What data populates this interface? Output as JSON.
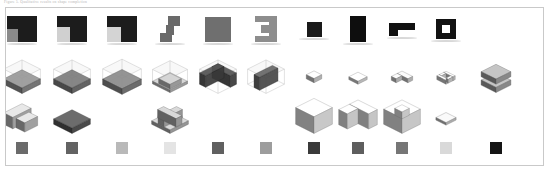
{
  "figure": {
    "caption": "Figure 5.  Qualitative results on shape completion",
    "panel_border_color": "#c9c9c9",
    "background_color": "#ffffff",
    "columns": 11,
    "rows": 4
  },
  "row_labels": {
    "shapes": "input-silhouettes",
    "recon": "reconstructed-voxels",
    "gt": "ground-truth-voxels",
    "swatches": "color-legend"
  },
  "grid": {
    "x_positions": [
      16,
      66,
      116,
      164,
      212,
      260,
      308,
      352,
      396,
      440,
      490
    ],
    "column_width": 46
  },
  "chart_data": {
    "type": "table",
    "title": "Qualitative results on shape completion",
    "categories": [
      "1",
      "2",
      "3",
      "4",
      "5",
      "6",
      "7",
      "8",
      "9",
      "10",
      "11"
    ],
    "series": [
      {
        "name": "input-silhouettes",
        "values": [
          1,
          1,
          1,
          1,
          1,
          1,
          1,
          1,
          1,
          1,
          0
        ]
      },
      {
        "name": "reconstructed-voxels",
        "values": [
          1,
          1,
          1,
          1,
          1,
          1,
          1,
          1,
          1,
          1,
          1
        ]
      },
      {
        "name": "ground-truth-voxels",
        "values": [
          1,
          1,
          0,
          1,
          0,
          0,
          1,
          1,
          1,
          1,
          0
        ]
      },
      {
        "name": "color-legend",
        "values": [
          1,
          1,
          1,
          1,
          1,
          1,
          1,
          1,
          1,
          1,
          1
        ]
      }
    ]
  },
  "silhouettes": [
    {
      "name": "block-square-notch-1",
      "fill": "#1c1c1c",
      "w": 30,
      "h": 26,
      "parts": [
        {
          "x": 0,
          "y": 0,
          "w": 30,
          "h": 26,
          "c": "#1c1c1c"
        },
        {
          "x": 0,
          "y": 13,
          "w": 11,
          "h": 13,
          "c": "#8a8a8a"
        }
      ]
    },
    {
      "name": "block-square-notch-2",
      "fill": "#1c1c1c",
      "w": 30,
      "h": 26,
      "parts": [
        {
          "x": 0,
          "y": 0,
          "w": 30,
          "h": 26,
          "c": "#1c1c1c"
        },
        {
          "x": 0,
          "y": 11,
          "w": 13,
          "h": 15,
          "c": "#d0d0d0"
        },
        {
          "x": 0,
          "y": 0,
          "w": 30,
          "h": 5,
          "c": "#1c1c1c"
        }
      ]
    },
    {
      "name": "block-square-notch-3",
      "fill": "#1c1c1c",
      "w": 30,
      "h": 26,
      "parts": [
        {
          "x": 0,
          "y": 0,
          "w": 30,
          "h": 26,
          "c": "#1c1c1c"
        },
        {
          "x": 0,
          "y": 11,
          "w": 14,
          "h": 15,
          "c": "#d4d4d4"
        }
      ]
    },
    {
      "name": "block-s-step",
      "fill": "#6a6a6a",
      "w": 20,
      "h": 26,
      "parts": [
        {
          "x": 8,
          "y": 0,
          "w": 12,
          "h": 10,
          "c": "#6a6a6a"
        },
        {
          "x": 6,
          "y": 9,
          "w": 8,
          "h": 10,
          "c": "#6a6a6a"
        },
        {
          "x": 0,
          "y": 17,
          "w": 12,
          "h": 9,
          "c": "#6a6a6a"
        }
      ]
    },
    {
      "name": "block-solid-square",
      "fill": "#6f6f6f",
      "w": 26,
      "h": 25,
      "parts": [
        {
          "x": 0,
          "y": 0,
          "w": 26,
          "h": 25,
          "c": "#6f6f6f"
        }
      ]
    },
    {
      "name": "block-c-bracket",
      "fill": "#8d8d8d",
      "w": 22,
      "h": 26,
      "parts": [
        {
          "x": 0,
          "y": 0,
          "w": 22,
          "h": 6,
          "c": "#8d8d8d"
        },
        {
          "x": 14,
          "y": 0,
          "w": 8,
          "h": 26,
          "c": "#8d8d8d"
        },
        {
          "x": 0,
          "y": 20,
          "w": 22,
          "h": 6,
          "c": "#8d8d8d"
        },
        {
          "x": 6,
          "y": 9,
          "w": 10,
          "h": 8,
          "c": "#8d8d8d"
        }
      ]
    },
    {
      "name": "block-small-square",
      "fill": "#1a1a1a",
      "w": 15,
      "h": 15,
      "parts": [
        {
          "x": 0,
          "y": 0,
          "w": 15,
          "h": 15,
          "c": "#1a1a1a"
        }
      ]
    },
    {
      "name": "block-tall-rect",
      "fill": "#0e0e0e",
      "w": 16,
      "h": 26,
      "parts": [
        {
          "x": 0,
          "y": 0,
          "w": 16,
          "h": 26,
          "c": "#0e0e0e"
        }
      ]
    },
    {
      "name": "block-l-flag",
      "fill": "#111111",
      "w": 26,
      "h": 13,
      "parts": [
        {
          "x": 0,
          "y": 0,
          "w": 26,
          "h": 7,
          "c": "#111111"
        },
        {
          "x": 0,
          "y": 6,
          "w": 9,
          "h": 7,
          "c": "#111111"
        }
      ]
    },
    {
      "name": "block-ring-square",
      "fill": "#121212",
      "w": 20,
      "h": 20,
      "parts": [
        {
          "x": 0,
          "y": 0,
          "w": 20,
          "h": 20,
          "c": "#121212"
        },
        {
          "x": 6,
          "y": 6,
          "w": 8,
          "h": 8,
          "c": "#ffffff"
        }
      ]
    }
  ],
  "recon": [
    {
      "name": "iso-slab-low",
      "style": "slab",
      "box": true,
      "tone": "#6e6e6e",
      "scale": 1.0
    },
    {
      "name": "iso-slab-thin",
      "style": "slab",
      "box": true,
      "tone": "#5a5a5a",
      "scale": 1.0
    },
    {
      "name": "iso-slab-wide",
      "style": "slab",
      "box": true,
      "tone": "#656565",
      "scale": 1.05
    },
    {
      "name": "iso-notch-step",
      "style": "step",
      "box": true,
      "tone": "#9a9a9a",
      "scale": 0.95
    },
    {
      "name": "iso-open-corner",
      "style": "corner",
      "box": true,
      "tone": "#3b3b3b",
      "scale": 1.0
    },
    {
      "name": "iso-wall-panel",
      "style": "wall",
      "box": true,
      "tone": "#4a4a4a",
      "scale": 1.0
    },
    {
      "name": "iso-tiny-cube",
      "style": "cube",
      "box": false,
      "tone": "#b8b8b8",
      "scale": 0.42
    },
    {
      "name": "iso-tiny-plate",
      "style": "plate",
      "box": false,
      "tone": "#c2c2c2",
      "scale": 0.5
    },
    {
      "name": "iso-chevron",
      "style": "chevron",
      "box": false,
      "tone": "#b6b6b6",
      "scale": 0.58
    },
    {
      "name": "iso-hex-ring",
      "style": "ring",
      "box": false,
      "tone": "#bdbdbd",
      "scale": 0.5
    },
    {
      "name": "iso-stack-pair",
      "style": "stack",
      "box": false,
      "tone": "#8f8f8f",
      "scale": 0.95
    }
  ],
  "gt": [
    {
      "name": "iso-gt-pair",
      "style": "pair",
      "tone": "#a8a8a8",
      "scale": 1.0
    },
    {
      "name": "iso-gt-slab",
      "style": "slab",
      "tone": "#4e4e4e",
      "scale": 1.0
    },
    {
      "name": "iso-gt-empty-3",
      "style": "empty",
      "tone": "#ffffff",
      "scale": 0
    },
    {
      "name": "iso-gt-crossbox",
      "style": "cross",
      "tone": "#9d9d9d",
      "scale": 1.0
    },
    {
      "name": "iso-gt-empty-5",
      "style": "empty",
      "tone": "#ffffff",
      "scale": 0
    },
    {
      "name": "iso-gt-empty-6",
      "style": "empty",
      "tone": "#ffffff",
      "scale": 0
    },
    {
      "name": "iso-gt-tall-cube",
      "style": "tall",
      "tone": "#d2d2d2",
      "scale": 1.0
    },
    {
      "name": "iso-gt-concave",
      "style": "concave",
      "tone": "#cfcfcf",
      "scale": 1.05
    },
    {
      "name": "iso-gt-hex-shell",
      "style": "shell",
      "tone": "#d0d0d0",
      "scale": 1.0
    },
    {
      "name": "iso-gt-small-slab",
      "style": "smallslab",
      "tone": "#b5b5b5",
      "scale": 0.55
    },
    {
      "name": "iso-gt-empty-11",
      "style": "empty",
      "tone": "#ffffff",
      "scale": 0
    }
  ],
  "swatches": [
    {
      "name": "swatch-1",
      "color": "#6b6b6b"
    },
    {
      "name": "swatch-2",
      "color": "#636363"
    },
    {
      "name": "swatch-3",
      "color": "#b9b9b9"
    },
    {
      "name": "swatch-4",
      "color": "#e4e4e4"
    },
    {
      "name": "swatch-5",
      "color": "#606060"
    },
    {
      "name": "swatch-6",
      "color": "#9d9d9d"
    },
    {
      "name": "swatch-7",
      "color": "#3a3a3a"
    },
    {
      "name": "swatch-8",
      "color": "#5e5e5e"
    },
    {
      "name": "swatch-9",
      "color": "#767676"
    },
    {
      "name": "swatch-10",
      "color": "#d9d9d9"
    },
    {
      "name": "swatch-11",
      "color": "#151515"
    }
  ]
}
